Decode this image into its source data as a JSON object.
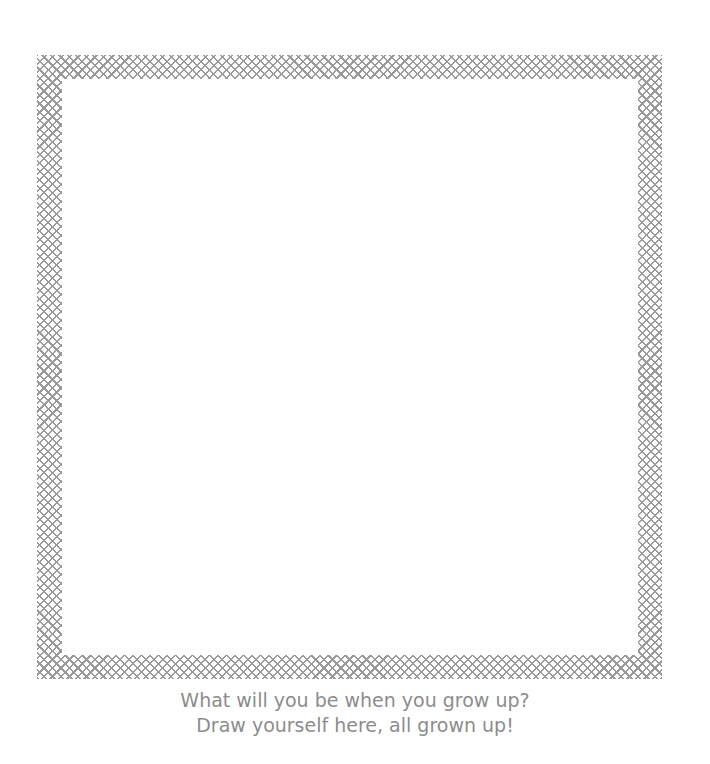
{
  "worksheet": {
    "frame": {
      "pattern": "crosshatch",
      "color": "#9a9a9a"
    },
    "caption": {
      "line1": "What will you be when you grow up?",
      "line2": "Draw yourself here, all grown up!"
    }
  }
}
